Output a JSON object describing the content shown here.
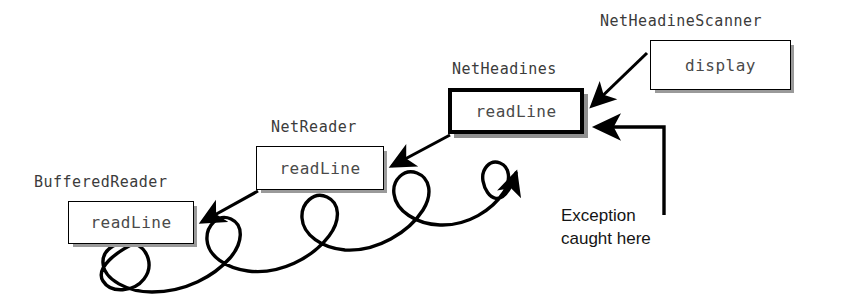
{
  "diagram": {
    "background_color": "#ffffff",
    "line_color": "#000000",
    "box_border_color": "#000000",
    "box_shadow_color": "#9a9a9a",
    "caption_color": "#3b3b3b",
    "method_label_color": "#4a4a4a",
    "note_color": "#141414"
  },
  "boxes": [
    {
      "id": "buffered-reader",
      "class_name": "BufferedReader",
      "method": "readLine",
      "emphasis": "normal"
    },
    {
      "id": "net-reader",
      "class_name": "NetReader",
      "method": "readLine",
      "emphasis": "normal"
    },
    {
      "id": "net-headines",
      "class_name": "NetHeadines",
      "method": "readLine",
      "emphasis": "thick"
    },
    {
      "id": "net-headine-scanner",
      "class_name": "NetHeadineScanner",
      "method": "display",
      "emphasis": "normal"
    }
  ],
  "annotation": {
    "line1": "Exception",
    "line2": "caught here"
  }
}
